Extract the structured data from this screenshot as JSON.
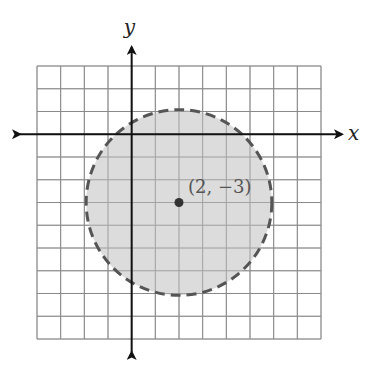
{
  "diagram": {
    "type": "coordinate-plane-inequality",
    "axes": {
      "x_label": "x",
      "y_label": "y"
    },
    "grid": {
      "columns": 12,
      "rows": 12,
      "x_min": -4,
      "x_max": 8,
      "y_max": 3,
      "y_min": -9
    },
    "circle": {
      "center": [
        2,
        -3
      ],
      "radius": 4,
      "boundary": "dashed",
      "interior_shaded": true,
      "fill_color": "#d6d6d6",
      "stroke_color": "#555555"
    },
    "center_point": {
      "label": "(2, −3)"
    }
  }
}
